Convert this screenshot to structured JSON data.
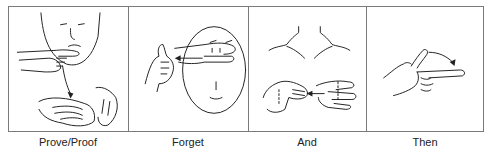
{
  "figure": {
    "panels": [
      {
        "id": "prove",
        "label": "Prove/Proof",
        "width": 120
      },
      {
        "id": "forget",
        "label": "Forget",
        "width": 120
      },
      {
        "id": "and",
        "label": "And",
        "width": 118
      },
      {
        "id": "then",
        "label": "Then",
        "width": 118
      }
    ],
    "border_color": "#7a7a7a",
    "line_color": "#222222"
  }
}
